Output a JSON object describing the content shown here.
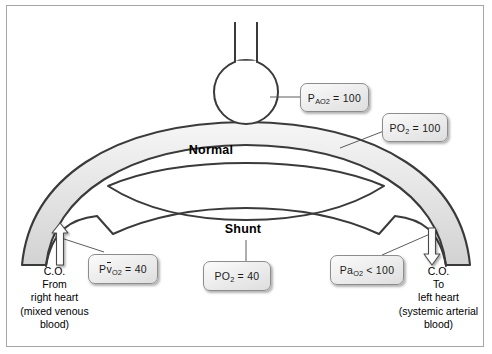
{
  "diagram": {
    "regions": [
      {
        "name": "normal",
        "label": "Normal"
      },
      {
        "name": "shunt",
        "label": "Shunt"
      }
    ],
    "callouts": [
      {
        "name": "alveolar-po2",
        "prefix": "P",
        "sub": "AO",
        "sub2": "2",
        "operator": "=",
        "value": "100",
        "plain": "PAO2 = 100",
        "points_to": "alveolus"
      },
      {
        "name": "end-capillary-po2",
        "prefix": "P",
        "sub": "O",
        "sub2": "2",
        "operator": "=",
        "value": "100",
        "plain": "Po2 = 100",
        "points_to": "normal-capillary"
      },
      {
        "name": "mixed-venous-po2",
        "prefix": "P",
        "vbar": "v",
        "sub": "O",
        "sub2": "2",
        "operator": "=",
        "value": "40",
        "plain": "PvO2 = 40",
        "points_to": "inflow-capillary"
      },
      {
        "name": "shunt-po2",
        "prefix": "P",
        "sub": "O",
        "sub2": "2",
        "operator": "=",
        "value": "40",
        "plain": "Po2 = 40",
        "points_to": "shunt-channel"
      },
      {
        "name": "arterial-po2",
        "prefix": "Pa",
        "sub": "O",
        "sub2": "2",
        "operator": "<",
        "value": "100",
        "plain": "PaO2 < 100",
        "points_to": "outflow-capillary"
      }
    ],
    "notes": [
      {
        "name": "inflow-note",
        "side": "left",
        "lines": [
          "C.O.",
          "From",
          "right heart",
          "(mixed venous",
          "blood)"
        ],
        "arrow": "up-arrow-icon"
      },
      {
        "name": "outflow-note",
        "side": "right",
        "lines": [
          "C.O.",
          "To",
          "left heart",
          "(systemic arterial",
          "blood)"
        ],
        "arrow": "down-arrow-icon"
      }
    ],
    "parts": [
      {
        "name": "alveolus",
        "shape": "circle-with-airway"
      },
      {
        "name": "airway",
        "shape": "tube"
      },
      {
        "name": "capillary-band",
        "shape": "arc"
      }
    ],
    "colors": {
      "vessel_fill_light": "#f2f2f2",
      "vessel_fill_dark": "#d9d9d9",
      "outline": "#3a3a3a",
      "frame_border": "#a6a6a6",
      "background": "#ffffff",
      "callout_border": "#8d8d8d",
      "text": "#000000"
    }
  }
}
